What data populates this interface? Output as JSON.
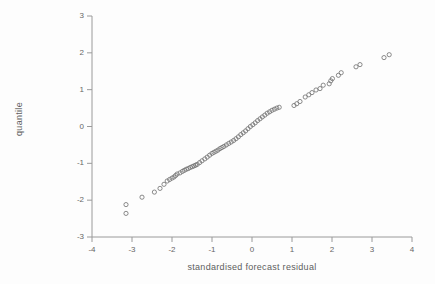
{
  "colors": {
    "background": "#fdfdfd",
    "axis": "#9a9a9a",
    "tick_text": "#666666",
    "label_text": "#5d5d5d",
    "marker_stroke": "#6e6e6e"
  },
  "chart_data": {
    "type": "scatter",
    "title": "",
    "xlabel": "standardised forecast residual",
    "ylabel": "quantile",
    "xlim": [
      -4,
      4
    ],
    "ylim": [
      -3,
      3
    ],
    "x_ticks": [
      -4,
      -3,
      -2,
      -1,
      0,
      1,
      2,
      3,
      4
    ],
    "y_ticks": [
      -3,
      -2,
      -1,
      0,
      1,
      2,
      3
    ],
    "grid": false,
    "legend": "none",
    "marker": "open-circle",
    "points": [
      [
        -3.15,
        -2.36
      ],
      [
        -3.15,
        -2.12
      ],
      [
        -2.75,
        -1.92
      ],
      [
        -2.44,
        -1.78
      ],
      [
        -2.3,
        -1.68
      ],
      [
        -2.2,
        -1.57
      ],
      [
        -2.12,
        -1.48
      ],
      [
        -2.06,
        -1.44
      ],
      [
        -2.0,
        -1.4
      ],
      [
        -1.95,
        -1.37
      ],
      [
        -1.91,
        -1.33
      ],
      [
        -1.87,
        -1.29
      ],
      [
        -1.8,
        -1.26
      ],
      [
        -1.74,
        -1.22
      ],
      [
        -1.69,
        -1.19
      ],
      [
        -1.64,
        -1.16
      ],
      [
        -1.59,
        -1.14
      ],
      [
        -1.54,
        -1.11
      ],
      [
        -1.49,
        -1.09
      ],
      [
        -1.45,
        -1.07
      ],
      [
        -1.41,
        -1.05
      ],
      [
        -1.37,
        -1.03
      ],
      [
        -1.31,
        -0.98
      ],
      [
        -1.25,
        -0.93
      ],
      [
        -1.18,
        -0.88
      ],
      [
        -1.12,
        -0.83
      ],
      [
        -1.06,
        -0.78
      ],
      [
        -1.0,
        -0.73
      ],
      [
        -0.95,
        -0.7
      ],
      [
        -0.9,
        -0.67
      ],
      [
        -0.85,
        -0.64
      ],
      [
        -0.8,
        -0.6
      ],
      [
        -0.75,
        -0.57
      ],
      [
        -0.7,
        -0.54
      ],
      [
        -0.64,
        -0.5
      ],
      [
        -0.58,
        -0.46
      ],
      [
        -0.52,
        -0.42
      ],
      [
        -0.46,
        -0.38
      ],
      [
        -0.4,
        -0.33
      ],
      [
        -0.34,
        -0.28
      ],
      [
        -0.28,
        -0.22
      ],
      [
        -0.22,
        -0.17
      ],
      [
        -0.16,
        -0.12
      ],
      [
        -0.1,
        -0.06
      ],
      [
        -0.04,
        0.0
      ],
      [
        0.02,
        0.05
      ],
      [
        0.08,
        0.1
      ],
      [
        0.14,
        0.16
      ],
      [
        0.2,
        0.21
      ],
      [
        0.26,
        0.26
      ],
      [
        0.32,
        0.31
      ],
      [
        0.38,
        0.36
      ],
      [
        0.44,
        0.4
      ],
      [
        0.5,
        0.44
      ],
      [
        0.56,
        0.47
      ],
      [
        0.62,
        0.5
      ],
      [
        0.68,
        0.52
      ],
      [
        1.05,
        0.57
      ],
      [
        1.12,
        0.62
      ],
      [
        1.2,
        0.68
      ],
      [
        1.33,
        0.8
      ],
      [
        1.42,
        0.86
      ],
      [
        1.5,
        0.92
      ],
      [
        1.6,
        0.99
      ],
      [
        1.7,
        1.03
      ],
      [
        1.78,
        1.12
      ],
      [
        1.93,
        1.16
      ],
      [
        1.97,
        1.24
      ],
      [
        2.01,
        1.3
      ],
      [
        2.16,
        1.39
      ],
      [
        2.23,
        1.46
      ],
      [
        2.6,
        1.62
      ],
      [
        2.7,
        1.68
      ],
      [
        3.3,
        1.87
      ],
      [
        3.43,
        1.95
      ]
    ]
  }
}
